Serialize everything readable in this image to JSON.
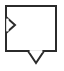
{
  "canvas": {
    "width": 64,
    "height": 71,
    "background_color": "#ffffff"
  },
  "diagram": {
    "stroke_color": "#2b2b2b",
    "fill_color": "#ffffff",
    "stroke_width": 2,
    "body": {
      "shape": "rectangle",
      "label": "",
      "x": 6,
      "y": 6,
      "width": 50,
      "height": 45
    },
    "ports": [
      {
        "name": "input-port",
        "icon": "triangle-right-icon",
        "direction": "right",
        "edge": "left",
        "label": "",
        "apex_x": 15,
        "apex_y": 25,
        "base_x": 6,
        "base_top_y": 17,
        "base_bottom_y": 33,
        "points": "6,17 15,25 6,33"
      },
      {
        "name": "output-port",
        "icon": "triangle-down-icon",
        "direction": "down",
        "edge": "bottom",
        "label": "",
        "apex_x": 36,
        "apex_y": 63,
        "base_y": 51,
        "base_left_x": 28,
        "base_right_x": 44,
        "points": "28,51 44,51 36,63"
      }
    ]
  }
}
